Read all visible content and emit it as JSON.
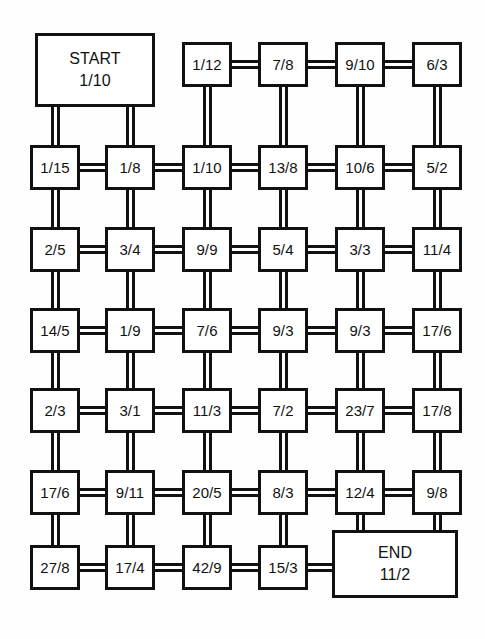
{
  "diagram": {
    "type": "node-grid-network",
    "colors": {
      "background": "#fefefe",
      "node_fill": "#ffffff",
      "stroke": "#111111"
    },
    "start": {
      "name": "START",
      "value": "1/10"
    },
    "end": {
      "name": "END",
      "value": "11/2"
    },
    "nodes": [
      {
        "id": "r1c3",
        "label": "1/12",
        "row": 1,
        "col": 3
      },
      {
        "id": "r1c4",
        "label": "7/8",
        "row": 1,
        "col": 4
      },
      {
        "id": "r1c5",
        "label": "9/10",
        "row": 1,
        "col": 5
      },
      {
        "id": "r1c6",
        "label": "6/3",
        "row": 1,
        "col": 6
      },
      {
        "id": "r2c1",
        "label": "1/15",
        "row": 2,
        "col": 1
      },
      {
        "id": "r2c2",
        "label": "1/8",
        "row": 2,
        "col": 2
      },
      {
        "id": "r2c3",
        "label": "1/10",
        "row": 2,
        "col": 3
      },
      {
        "id": "r2c4",
        "label": "13/8",
        "row": 2,
        "col": 4
      },
      {
        "id": "r2c5",
        "label": "10/6",
        "row": 2,
        "col": 5
      },
      {
        "id": "r2c6",
        "label": "5/2",
        "row": 2,
        "col": 6
      },
      {
        "id": "r3c1",
        "label": "2/5",
        "row": 3,
        "col": 1
      },
      {
        "id": "r3c2",
        "label": "3/4",
        "row": 3,
        "col": 2
      },
      {
        "id": "r3c3",
        "label": "9/9",
        "row": 3,
        "col": 3
      },
      {
        "id": "r3c4",
        "label": "5/4",
        "row": 3,
        "col": 4
      },
      {
        "id": "r3c5",
        "label": "3/3",
        "row": 3,
        "col": 5
      },
      {
        "id": "r3c6",
        "label": "11/4",
        "row": 3,
        "col": 6
      },
      {
        "id": "r4c1",
        "label": "14/5",
        "row": 4,
        "col": 1
      },
      {
        "id": "r4c2",
        "label": "1/9",
        "row": 4,
        "col": 2
      },
      {
        "id": "r4c3",
        "label": "7/6",
        "row": 4,
        "col": 3
      },
      {
        "id": "r4c4",
        "label": "9/3",
        "row": 4,
        "col": 4
      },
      {
        "id": "r4c5",
        "label": "9/3",
        "row": 4,
        "col": 5
      },
      {
        "id": "r4c6",
        "label": "17/6",
        "row": 4,
        "col": 6
      },
      {
        "id": "r5c1",
        "label": "2/3",
        "row": 5,
        "col": 1
      },
      {
        "id": "r5c2",
        "label": "3/1",
        "row": 5,
        "col": 2
      },
      {
        "id": "r5c3",
        "label": "11/3",
        "row": 5,
        "col": 3
      },
      {
        "id": "r5c4",
        "label": "7/2",
        "row": 5,
        "col": 4
      },
      {
        "id": "r5c5",
        "label": "23/7",
        "row": 5,
        "col": 5
      },
      {
        "id": "r5c6",
        "label": "17/8",
        "row": 5,
        "col": 6
      },
      {
        "id": "r6c1",
        "label": "17/6",
        "row": 6,
        "col": 1
      },
      {
        "id": "r6c2",
        "label": "9/11",
        "row": 6,
        "col": 2
      },
      {
        "id": "r6c3",
        "label": "20/5",
        "row": 6,
        "col": 3
      },
      {
        "id": "r6c4",
        "label": "8/3",
        "row": 6,
        "col": 4
      },
      {
        "id": "r6c5",
        "label": "12/4",
        "row": 6,
        "col": 5
      },
      {
        "id": "r6c6",
        "label": "9/8",
        "row": 6,
        "col": 6
      },
      {
        "id": "r7c1",
        "label": "27/8",
        "row": 7,
        "col": 1
      },
      {
        "id": "r7c2",
        "label": "17/4",
        "row": 7,
        "col": 2
      },
      {
        "id": "r7c3",
        "label": "42/9",
        "row": 7,
        "col": 3
      },
      {
        "id": "r7c4",
        "label": "15/3",
        "row": 7,
        "col": 4
      }
    ],
    "geometry": {
      "columns_x": [
        30,
        105,
        182,
        258,
        335,
        412
      ],
      "rows_y": [
        42,
        145,
        227,
        308,
        388,
        470,
        545
      ],
      "node_width": 50,
      "node_height": 45,
      "start_box": {
        "x": 35,
        "y": 33,
        "w": 120,
        "h": 74
      },
      "end_box": {
        "x": 332,
        "y": 530,
        "w": 126,
        "h": 68
      }
    },
    "edges_horizontal": [
      {
        "row": 1,
        "from_col": 3,
        "to_col": 4
      },
      {
        "row": 1,
        "from_col": 4,
        "to_col": 5
      },
      {
        "row": 1,
        "from_col": 5,
        "to_col": 6
      },
      {
        "row": 2,
        "from_col": 1,
        "to_col": 2
      },
      {
        "row": 2,
        "from_col": 2,
        "to_col": 3
      },
      {
        "row": 2,
        "from_col": 3,
        "to_col": 4
      },
      {
        "row": 2,
        "from_col": 4,
        "to_col": 5
      },
      {
        "row": 2,
        "from_col": 5,
        "to_col": 6
      },
      {
        "row": 3,
        "from_col": 1,
        "to_col": 2
      },
      {
        "row": 3,
        "from_col": 2,
        "to_col": 3
      },
      {
        "row": 3,
        "from_col": 3,
        "to_col": 4
      },
      {
        "row": 3,
        "from_col": 4,
        "to_col": 5
      },
      {
        "row": 3,
        "from_col": 5,
        "to_col": 6
      },
      {
        "row": 4,
        "from_col": 1,
        "to_col": 2
      },
      {
        "row": 4,
        "from_col": 2,
        "to_col": 3
      },
      {
        "row": 4,
        "from_col": 3,
        "to_col": 4
      },
      {
        "row": 4,
        "from_col": 4,
        "to_col": 5
      },
      {
        "row": 4,
        "from_col": 5,
        "to_col": 6
      },
      {
        "row": 5,
        "from_col": 1,
        "to_col": 2
      },
      {
        "row": 5,
        "from_col": 2,
        "to_col": 3
      },
      {
        "row": 5,
        "from_col": 3,
        "to_col": 4
      },
      {
        "row": 5,
        "from_col": 4,
        "to_col": 5
      },
      {
        "row": 5,
        "from_col": 5,
        "to_col": 6
      },
      {
        "row": 6,
        "from_col": 1,
        "to_col": 2
      },
      {
        "row": 6,
        "from_col": 2,
        "to_col": 3
      },
      {
        "row": 6,
        "from_col": 3,
        "to_col": 4
      },
      {
        "row": 6,
        "from_col": 4,
        "to_col": 5
      },
      {
        "row": 6,
        "from_col": 5,
        "to_col": 6
      },
      {
        "row": 7,
        "from_col": 1,
        "to_col": 2
      },
      {
        "row": 7,
        "from_col": 2,
        "to_col": 3
      },
      {
        "row": 7,
        "from_col": 3,
        "to_col": 4
      }
    ],
    "edges_vertical": [
      {
        "col": 1,
        "from_row": 1,
        "to_row": 2
      },
      {
        "col": 2,
        "from_row": 1,
        "to_row": 2
      },
      {
        "col": 3,
        "from_row": 1,
        "to_row": 2
      },
      {
        "col": 4,
        "from_row": 1,
        "to_row": 2
      },
      {
        "col": 5,
        "from_row": 1,
        "to_row": 2
      },
      {
        "col": 6,
        "from_row": 1,
        "to_row": 2
      },
      {
        "col": 1,
        "from_row": 2,
        "to_row": 3
      },
      {
        "col": 2,
        "from_row": 2,
        "to_row": 3
      },
      {
        "col": 3,
        "from_row": 2,
        "to_row": 3
      },
      {
        "col": 4,
        "from_row": 2,
        "to_row": 3
      },
      {
        "col": 5,
        "from_row": 2,
        "to_row": 3
      },
      {
        "col": 6,
        "from_row": 2,
        "to_row": 3
      },
      {
        "col": 1,
        "from_row": 3,
        "to_row": 4
      },
      {
        "col": 2,
        "from_row": 3,
        "to_row": 4
      },
      {
        "col": 3,
        "from_row": 3,
        "to_row": 4
      },
      {
        "col": 4,
        "from_row": 3,
        "to_row": 4
      },
      {
        "col": 5,
        "from_row": 3,
        "to_row": 4
      },
      {
        "col": 6,
        "from_row": 3,
        "to_row": 4
      },
      {
        "col": 1,
        "from_row": 4,
        "to_row": 5
      },
      {
        "col": 2,
        "from_row": 4,
        "to_row": 5
      },
      {
        "col": 3,
        "from_row": 4,
        "to_row": 5
      },
      {
        "col": 4,
        "from_row": 4,
        "to_row": 5
      },
      {
        "col": 5,
        "from_row": 4,
        "to_row": 5
      },
      {
        "col": 6,
        "from_row": 4,
        "to_row": 5
      },
      {
        "col": 1,
        "from_row": 5,
        "to_row": 6
      },
      {
        "col": 2,
        "from_row": 5,
        "to_row": 6
      },
      {
        "col": 3,
        "from_row": 5,
        "to_row": 6
      },
      {
        "col": 4,
        "from_row": 5,
        "to_row": 6
      },
      {
        "col": 5,
        "from_row": 5,
        "to_row": 6
      },
      {
        "col": 6,
        "from_row": 5,
        "to_row": 6
      },
      {
        "col": 1,
        "from_row": 6,
        "to_row": 7
      },
      {
        "col": 2,
        "from_row": 6,
        "to_row": 7
      },
      {
        "col": 3,
        "from_row": 6,
        "to_row": 7
      },
      {
        "col": 4,
        "from_row": 6,
        "to_row": 7
      }
    ]
  }
}
